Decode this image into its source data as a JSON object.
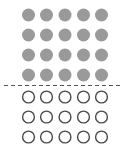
{
  "chart_data": {
    "type": "pictogram",
    "title": "",
    "columns": 5,
    "filled_rows": 4,
    "empty_rows": 3,
    "filled_count": 20,
    "empty_count": 15,
    "total": 35,
    "colors": {
      "filled": "#9a9a9a",
      "outline": "#4a4a4a",
      "divider": "#555555"
    },
    "divider": {
      "style": "dashed",
      "position": "between filled and empty rows"
    }
  },
  "layout": {
    "col_x": [
      28.5,
      46.5,
      65,
      83.5,
      101.5
    ],
    "filled_row_y": [
      15,
      35,
      55,
      75
    ],
    "empty_row_y": [
      97,
      117,
      137
    ],
    "radius": 6.5,
    "divider_y": 85.5,
    "divider_x1": 4,
    "divider_x2": 123
  }
}
